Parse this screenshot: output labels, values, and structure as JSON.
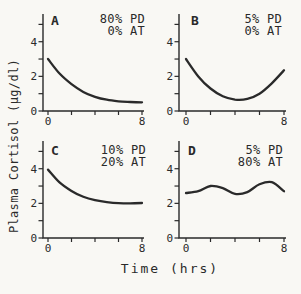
{
  "figure": {
    "ylabel": "Plasma Cortisol (μg/dl)",
    "xlabel": "Time (hrs)",
    "ink_color": "#2a2a2a",
    "background_color": "#f9f8f4"
  },
  "chart_data": [
    {
      "type": "line",
      "panel": "A",
      "annotation": [
        "80% PD",
        "0% AT"
      ],
      "x": [
        0,
        1,
        2,
        3,
        4,
        5,
        6,
        7,
        8
      ],
      "y": [
        3.0,
        2.15,
        1.55,
        1.1,
        0.82,
        0.65,
        0.56,
        0.52,
        0.5
      ],
      "xlim": [
        0,
        8
      ],
      "ylim": [
        0,
        5.6
      ],
      "xticks": [
        0,
        2,
        4,
        6,
        8
      ],
      "xtick_labels": [
        "0",
        "",
        "",
        "",
        "8"
      ],
      "yticks": [
        0,
        1,
        2,
        3,
        4,
        5
      ],
      "ytick_labels": [
        "0",
        "",
        "2",
        "",
        "4",
        ""
      ],
      "grid": false,
      "legend": null
    },
    {
      "type": "line",
      "panel": "B",
      "annotation": [
        "5% PD",
        "0% AT"
      ],
      "x": [
        0,
        1,
        2,
        3,
        4,
        5,
        6,
        7,
        8
      ],
      "y": [
        3.0,
        2.0,
        1.3,
        0.85,
        0.66,
        0.7,
        1.0,
        1.6,
        2.35
      ],
      "xlim": [
        0,
        8
      ],
      "ylim": [
        0,
        5.6
      ],
      "xticks": [
        0,
        2,
        4,
        6,
        8
      ],
      "xtick_labels": [
        "0",
        "",
        "",
        "",
        "8"
      ],
      "yticks": [
        0,
        1,
        2,
        3,
        4,
        5
      ],
      "ytick_labels": [
        "0",
        "",
        "2",
        "",
        "4",
        ""
      ],
      "grid": false,
      "legend": null
    },
    {
      "type": "line",
      "panel": "C",
      "annotation": [
        "10% PD",
        "20% AT"
      ],
      "x": [
        0,
        1,
        2,
        3,
        4,
        5,
        6,
        7,
        8
      ],
      "y": [
        3.95,
        3.2,
        2.72,
        2.38,
        2.18,
        2.07,
        2.01,
        2.0,
        2.02
      ],
      "xlim": [
        0,
        8
      ],
      "ylim": [
        0,
        5.6
      ],
      "xticks": [
        0,
        2,
        4,
        6,
        8
      ],
      "xtick_labels": [
        "0",
        "",
        "",
        "",
        "8"
      ],
      "yticks": [
        0,
        1,
        2,
        3,
        4,
        5
      ],
      "ytick_labels": [
        "0",
        "",
        "2",
        "",
        "4",
        ""
      ],
      "grid": false,
      "legend": null
    },
    {
      "type": "line",
      "panel": "D",
      "annotation": [
        "5% PD",
        "80% AT"
      ],
      "x": [
        0,
        1,
        2,
        3,
        4,
        5,
        6,
        7,
        8
      ],
      "y": [
        2.6,
        2.7,
        3.0,
        2.88,
        2.55,
        2.65,
        3.1,
        3.22,
        2.7
      ],
      "xlim": [
        0,
        8
      ],
      "ylim": [
        0,
        5.6
      ],
      "xticks": [
        0,
        2,
        4,
        6,
        8
      ],
      "xtick_labels": [
        "0",
        "",
        "",
        "",
        "8"
      ],
      "yticks": [
        0,
        1,
        2,
        3,
        4,
        5
      ],
      "ytick_labels": [
        "0",
        "",
        "2",
        "",
        "4",
        ""
      ],
      "grid": false,
      "legend": null
    }
  ]
}
